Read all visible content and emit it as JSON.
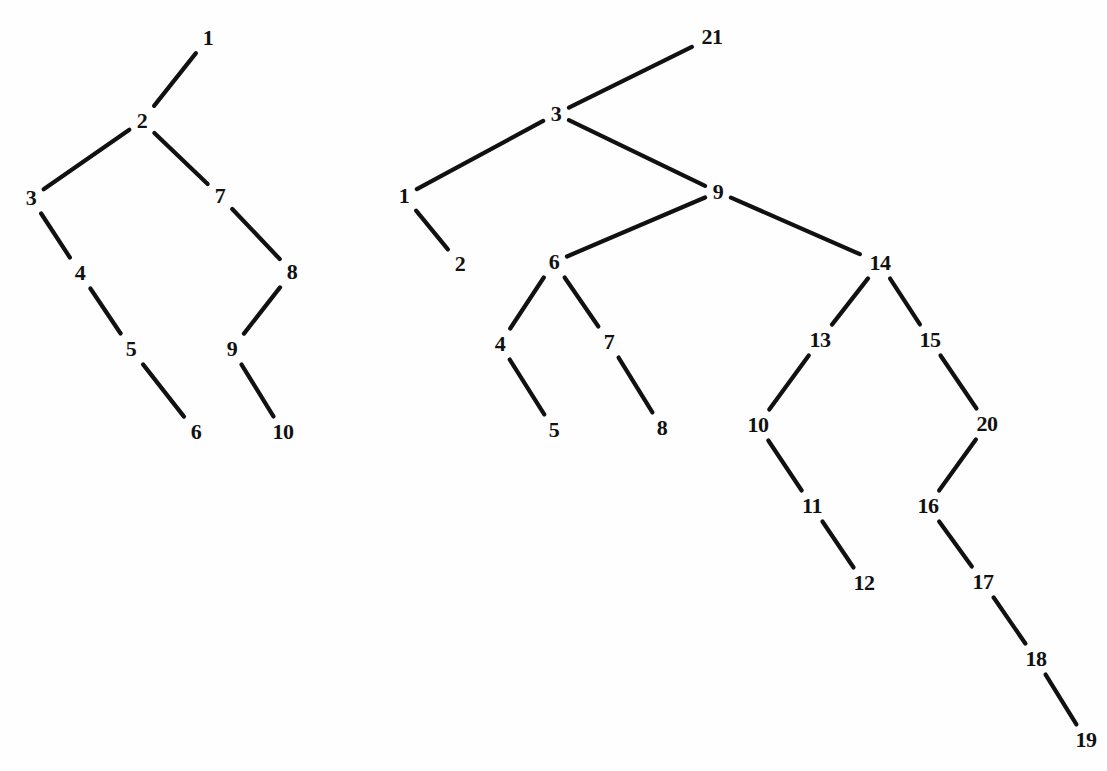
{
  "figure": {
    "background_color": "#fefefe",
    "ink_color": "#111111",
    "edge_stroke_width": 4.2,
    "label_font_size": 22,
    "width": 1107,
    "height": 771
  },
  "chart_data": {
    "type": "diagram",
    "title": "",
    "subtitle": "",
    "xlabel": "",
    "ylabel": "",
    "grid": false,
    "legend": "none",
    "graphs": [
      {
        "name": "left-tree",
        "node_count": 10,
        "edge_count": 9,
        "nodes": [
          {
            "id": "L1",
            "label": "1",
            "x": 208,
            "y": 38
          },
          {
            "id": "L2",
            "label": "2",
            "x": 142,
            "y": 121
          },
          {
            "id": "L3",
            "label": "3",
            "x": 31,
            "y": 198
          },
          {
            "id": "L4",
            "label": "4",
            "x": 80,
            "y": 273
          },
          {
            "id": "L5",
            "label": "5",
            "x": 131,
            "y": 349
          },
          {
            "id": "L6",
            "label": "6",
            "x": 196,
            "y": 432
          },
          {
            "id": "L7",
            "label": "7",
            "x": 220,
            "y": 196
          },
          {
            "id": "L8",
            "label": "8",
            "x": 292,
            "y": 272
          },
          {
            "id": "L9",
            "label": "9",
            "x": 232,
            "y": 349
          },
          {
            "id": "L10",
            "label": "10",
            "x": 283,
            "y": 432
          }
        ],
        "edges": [
          {
            "from": "L2",
            "to": "L1"
          },
          {
            "from": "L2",
            "to": "L3"
          },
          {
            "from": "L3",
            "to": "L4"
          },
          {
            "from": "L4",
            "to": "L5"
          },
          {
            "from": "L5",
            "to": "L6"
          },
          {
            "from": "L2",
            "to": "L7"
          },
          {
            "from": "L7",
            "to": "L8"
          },
          {
            "from": "L8",
            "to": "L9"
          },
          {
            "from": "L9",
            "to": "L10"
          }
        ]
      },
      {
        "name": "right-tree",
        "node_count": 21,
        "edge_count": 20,
        "nodes": [
          {
            "id": "R21",
            "label": "21",
            "x": 712,
            "y": 37
          },
          {
            "id": "R3",
            "label": "3",
            "x": 556,
            "y": 114
          },
          {
            "id": "R1",
            "label": "1",
            "x": 404,
            "y": 196
          },
          {
            "id": "R2",
            "label": "2",
            "x": 460,
            "y": 264
          },
          {
            "id": "R9",
            "label": "9",
            "x": 718,
            "y": 192
          },
          {
            "id": "R6",
            "label": "6",
            "x": 554,
            "y": 262
          },
          {
            "id": "R4",
            "label": "4",
            "x": 500,
            "y": 344
          },
          {
            "id": "R5",
            "label": "5",
            "x": 554,
            "y": 430
          },
          {
            "id": "R7",
            "label": "7",
            "x": 609,
            "y": 342
          },
          {
            "id": "R8",
            "label": "8",
            "x": 662,
            "y": 428
          },
          {
            "id": "R14",
            "label": "14",
            "x": 880,
            "y": 263
          },
          {
            "id": "R13",
            "label": "13",
            "x": 820,
            "y": 340
          },
          {
            "id": "R10",
            "label": "10",
            "x": 758,
            "y": 425
          },
          {
            "id": "R11",
            "label": "11",
            "x": 812,
            "y": 506
          },
          {
            "id": "R12",
            "label": "12",
            "x": 864,
            "y": 583
          },
          {
            "id": "R15",
            "label": "15",
            "x": 930,
            "y": 340
          },
          {
            "id": "R20",
            "label": "20",
            "x": 987,
            "y": 424
          },
          {
            "id": "R16",
            "label": "16",
            "x": 928,
            "y": 506
          },
          {
            "id": "R17",
            "label": "17",
            "x": 983,
            "y": 582
          },
          {
            "id": "R18",
            "label": "18",
            "x": 1036,
            "y": 659
          },
          {
            "id": "R19",
            "label": "19",
            "x": 1086,
            "y": 740
          }
        ],
        "edges": [
          {
            "from": "R3",
            "to": "R21"
          },
          {
            "from": "R3",
            "to": "R1"
          },
          {
            "from": "R1",
            "to": "R2"
          },
          {
            "from": "R3",
            "to": "R9"
          },
          {
            "from": "R9",
            "to": "R6"
          },
          {
            "from": "R6",
            "to": "R4"
          },
          {
            "from": "R4",
            "to": "R5"
          },
          {
            "from": "R6",
            "to": "R7"
          },
          {
            "from": "R7",
            "to": "R8"
          },
          {
            "from": "R9",
            "to": "R14"
          },
          {
            "from": "R14",
            "to": "R13"
          },
          {
            "from": "R13",
            "to": "R10"
          },
          {
            "from": "R10",
            "to": "R11"
          },
          {
            "from": "R11",
            "to": "R12"
          },
          {
            "from": "R14",
            "to": "R15"
          },
          {
            "from": "R15",
            "to": "R20"
          },
          {
            "from": "R20",
            "to": "R16"
          },
          {
            "from": "R16",
            "to": "R17"
          },
          {
            "from": "R17",
            "to": "R18"
          },
          {
            "from": "R18",
            "to": "R19"
          }
        ]
      }
    ]
  }
}
